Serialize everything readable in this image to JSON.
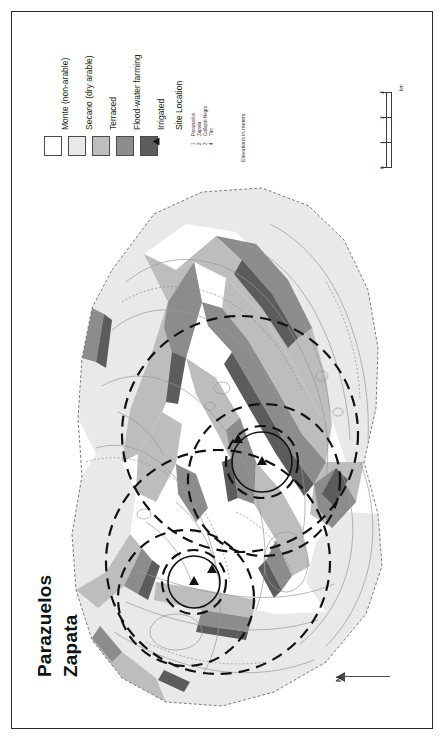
{
  "figure": {
    "kind": "land-use-map",
    "frame": true
  },
  "title": {
    "line1": "Parazuelos",
    "line2": "Zapata"
  },
  "legend": {
    "classes": [
      {
        "label": "Monte (non-arable)",
        "color": "#ffffff"
      },
      {
        "label": "Secano (dry arable)",
        "color": "#e9e9e9"
      },
      {
        "label": "Terraced",
        "color": "#bdbdbd"
      },
      {
        "label": "Flood-water farming",
        "color": "#8c8c8c"
      },
      {
        "label": "Irrigated",
        "color": "#5c5c5c"
      }
    ],
    "site_location": {
      "heading": "Site Location",
      "marker_icon": "triangle-marker",
      "sites": [
        {
          "num": "1",
          "name": "Parazuelos"
        },
        {
          "num": "2",
          "name": "Zapata"
        },
        {
          "num": "3",
          "name": "Callejon Negro"
        },
        {
          "num": "4",
          "name": "Tiro"
        }
      ]
    },
    "elevation_note": "Elevations in meters"
  },
  "scalebar": {
    "unit": "km",
    "ticks": [
      "3",
      "2",
      "1",
      "0"
    ]
  },
  "north_arrow": {
    "label": "N",
    "icon": "north-arrow-icon"
  },
  "map": {
    "site_markers": [
      {
        "id": "1",
        "name": "Parazuelos"
      },
      {
        "id": "2",
        "name": "Zapata"
      },
      {
        "id": "3",
        "name": "Callejon Negro"
      },
      {
        "id": "4",
        "name": "Tiro"
      }
    ],
    "catchment_circles": 6,
    "colors": {
      "monte": "#ffffff",
      "secano": "#e9e9e9",
      "terraced": "#bdbdbd",
      "floodwater": "#8c8c8c",
      "irrigated": "#5c5c5c",
      "contour": "#9a9a9a",
      "boundary": "#111111",
      "outline": "#6e6e6e"
    }
  }
}
